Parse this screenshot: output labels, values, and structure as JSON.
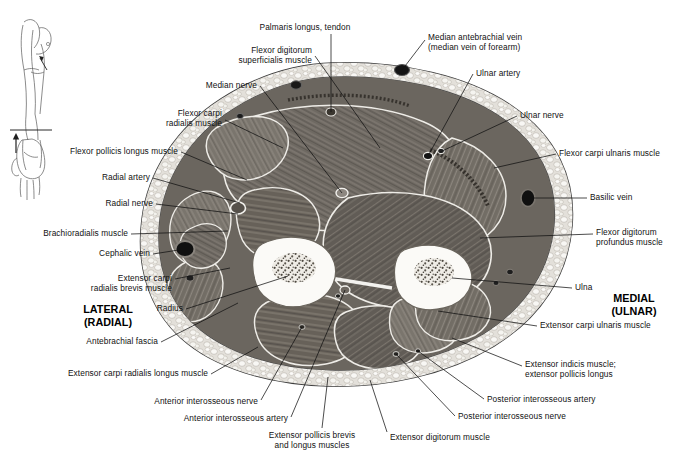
{
  "figure": {
    "orientation_key": {
      "name": "arm-orientation-diagram",
      "description": "Small line drawing of arm with section level line and viewing-direction arrow"
    },
    "side_markers": [
      {
        "id": "lateral",
        "line1": "LATERAL",
        "line2": "(RADIAL)",
        "x": 108,
        "y": 303
      },
      {
        "id": "medial",
        "line1": "MEDIAL",
        "line2": "(ULNAR)",
        "x": 634,
        "y": 292
      }
    ],
    "colors": {
      "background": "#ffffff",
      "text": "#111111",
      "leader": "#111111",
      "skin_outline": "#4a4a4a",
      "fat": "#e8e6e2",
      "fat_lobule": "#f7f6f3",
      "muscle_dark": "#595550",
      "muscle_mid": "#726d66",
      "muscle_light": "#8d8881",
      "fascia": "#f2f1ee",
      "bone_cortex": "#fbfaf7",
      "bone_marrow": "#8a857c",
      "vessel_dark": "#1c1c1c"
    },
    "labels": [
      {
        "id": "palmaris-longus-tendon",
        "text": "Palmaris longus, tendon",
        "align": "center",
        "x": 305,
        "y": 22,
        "w": 120,
        "leader": [
          [
            331,
            34
          ],
          [
            331,
            112
          ]
        ]
      },
      {
        "id": "flexor-digitorum-superficialis-muscle",
        "text": "Flexor digitorum\nsuperficialis muscle",
        "align": "right",
        "x": 312,
        "y": 45,
        "w": 110,
        "leader": [
          [
            315,
            56
          ],
          [
            380,
            148
          ]
        ]
      },
      {
        "id": "median-antebrachial-vein",
        "text": "Median antebrachial vein\n(median vein of forearm)",
        "align": "left",
        "x": 428,
        "y": 32,
        "w": 150,
        "leader": [
          [
            425,
            40
          ],
          [
            402,
            70
          ]
        ]
      },
      {
        "id": "median-nerve",
        "text": "Median nerve",
        "align": "right",
        "x": 257,
        "y": 80,
        "w": 100,
        "leader": [
          [
            260,
            86
          ],
          [
            342,
            193
          ]
        ]
      },
      {
        "id": "ulnar-artery",
        "text": "Ulnar artery",
        "align": "left",
        "x": 476,
        "y": 68,
        "w": 90,
        "leader": [
          [
            473,
            74
          ],
          [
            428,
            156
          ]
        ]
      },
      {
        "id": "flexor-carpi-radialis-muscle",
        "text": "Flexor carpi\nradialis muscle",
        "align": "right",
        "x": 222,
        "y": 108,
        "w": 100,
        "leader": [
          [
            225,
            120
          ],
          [
            283,
            148
          ]
        ]
      },
      {
        "id": "ulnar-nerve",
        "text": "Ulnar nerve",
        "align": "left",
        "x": 520,
        "y": 110,
        "w": 90,
        "leader": [
          [
            517,
            116
          ],
          [
            440,
            152
          ]
        ]
      },
      {
        "id": "flexor-pollicis-longus-muscle",
        "text": "Flexor pollicis longus muscle",
        "align": "right",
        "x": 178,
        "y": 146,
        "w": 150,
        "leader": [
          [
            181,
            152
          ],
          [
            247,
            180
          ]
        ]
      },
      {
        "id": "flexor-carpi-ulnaris-muscle",
        "text": "Flexor carpi ulnaris muscle",
        "align": "left",
        "x": 559,
        "y": 148,
        "w": 140,
        "leader": [
          [
            556,
            154
          ],
          [
            494,
            168
          ]
        ]
      },
      {
        "id": "radial-artery",
        "text": "Radial artery",
        "align": "right",
        "x": 150,
        "y": 172,
        "w": 100,
        "leader": [
          [
            153,
            178
          ],
          [
            240,
            203
          ]
        ]
      },
      {
        "id": "radial-nerve",
        "text": "Radial nerve",
        "align": "right",
        "x": 153,
        "y": 198,
        "w": 100,
        "leader": [
          [
            156,
            204
          ],
          [
            238,
            214
          ]
        ]
      },
      {
        "id": "basilic-vein",
        "text": "Basilic vein",
        "align": "left",
        "x": 590,
        "y": 192,
        "w": 80,
        "leader": [
          [
            587,
            198
          ],
          [
            528,
            198
          ]
        ]
      },
      {
        "id": "brachioradialis-muscle",
        "text": "Brachioradialis muscle",
        "align": "right",
        "x": 128,
        "y": 228,
        "w": 130,
        "leader": [
          [
            131,
            234
          ],
          [
            228,
            231
          ]
        ]
      },
      {
        "id": "flexor-digitorum-profundus-muscle",
        "text": "Flexor digitorum\nprofundus muscle",
        "align": "left",
        "x": 596,
        "y": 227,
        "w": 120,
        "leader": [
          [
            593,
            234
          ],
          [
            480,
            238
          ]
        ]
      },
      {
        "id": "cephalic-vein",
        "text": "Cephalic vein",
        "align": "right",
        "x": 150,
        "y": 248,
        "w": 100,
        "leader": [
          [
            153,
            254
          ],
          [
            185,
            249
          ]
        ]
      },
      {
        "id": "extensor-carpi-radialis-brevis-muscle",
        "text": "Extensor carpi\nradialis brevis muscle",
        "align": "right",
        "x": 172,
        "y": 273,
        "w": 118,
        "leader": [
          [
            175,
            279
          ],
          [
            230,
            268
          ]
        ]
      },
      {
        "id": "ulna",
        "text": "Ulna",
        "align": "left",
        "x": 575,
        "y": 282,
        "w": 60,
        "leader": [
          [
            572,
            288
          ],
          [
            452,
            278
          ]
        ]
      },
      {
        "id": "radius",
        "text": "Radius",
        "align": "right",
        "x": 183,
        "y": 303,
        "w": 60,
        "leader": [
          [
            186,
            309
          ],
          [
            288,
            276
          ]
        ]
      },
      {
        "id": "extensor-carpi-ulnaris-muscle",
        "text": "Extensor carpi ulnaris muscle",
        "align": "left",
        "x": 540,
        "y": 320,
        "w": 150,
        "leader": [
          [
            537,
            326
          ],
          [
            438,
            311
          ]
        ]
      },
      {
        "id": "antebrachial-fascia",
        "text": "Antebrachial fascia",
        "align": "right",
        "x": 158,
        "y": 336,
        "w": 120,
        "leader": [
          [
            161,
            342
          ],
          [
            238,
            303
          ]
        ]
      },
      {
        "id": "extensor-carpi-radialis-longus-muscle",
        "text": "Extensor carpi radialis longus muscle",
        "align": "right",
        "x": 208,
        "y": 368,
        "w": 190,
        "leader": [
          [
            211,
            374
          ],
          [
            258,
            347
          ]
        ]
      },
      {
        "id": "extensor-indicis-muscle",
        "text": "Extensor indicis muscle;\nextensor pollicis longus",
        "align": "left",
        "x": 525,
        "y": 359,
        "w": 140,
        "leader": [
          [
            522,
            366
          ],
          [
            452,
            338
          ]
        ]
      },
      {
        "id": "anterior-interosseous-nerve",
        "text": "Anterior interosseous nerve",
        "align": "right",
        "x": 258,
        "y": 396,
        "w": 150,
        "leader": [
          [
            261,
            400
          ],
          [
            302,
            327
          ]
        ]
      },
      {
        "id": "posterior-interosseous-artery",
        "text": "Posterior interosseous artery",
        "align": "left",
        "x": 487,
        "y": 394,
        "w": 150,
        "leader": [
          [
            484,
            399
          ],
          [
            418,
            351
          ]
        ]
      },
      {
        "id": "anterior-interosseous-artery",
        "text": "Anterior interosseous artery",
        "align": "right",
        "x": 288,
        "y": 413,
        "w": 150,
        "leader": [
          [
            291,
            417
          ],
          [
            345,
            290
          ]
        ]
      },
      {
        "id": "posterior-interosseous-nerve",
        "text": "Posterior interosseous nerve",
        "align": "left",
        "x": 458,
        "y": 411,
        "w": 150,
        "leader": [
          [
            455,
            416
          ],
          [
            396,
            354
          ]
        ]
      },
      {
        "id": "extensor-digitorum-muscle",
        "text": "Extensor digitorum muscle",
        "align": "left",
        "x": 390,
        "y": 432,
        "w": 150,
        "leader": [
          [
            387,
            432
          ],
          [
            370,
            380
          ]
        ]
      },
      {
        "id": "extensor-pollicis-brevis-longus",
        "text": "Extensor pollicis brevis\nand longus muscles",
        "align": "center",
        "x": 312,
        "y": 430,
        "w": 140,
        "leader": [
          [
            322,
            428
          ],
          [
            328,
            377
          ]
        ]
      }
    ]
  }
}
